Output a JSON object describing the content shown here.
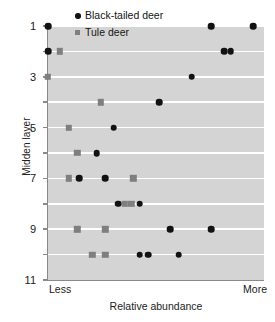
{
  "chart_data": {
    "type": "scatter",
    "title": "",
    "xlabel": "Relative abundance",
    "ylabel": "Midden layer",
    "xlim": [
      0,
      1
    ],
    "ylim": [
      11,
      1
    ],
    "y_inverted": true,
    "grid": "horizontal",
    "plot_background": "#d4d4d4",
    "gridline_color": "#ffffff",
    "x_axis_endpoints": {
      "left": "Less",
      "right": "More"
    },
    "x_tick_labels": [],
    "y_tick_values": [
      1,
      2,
      3,
      4,
      5,
      6,
      7,
      8,
      9,
      10,
      11
    ],
    "y_tick_labels": [
      "1",
      "",
      "3",
      "",
      "5",
      "",
      "7",
      "",
      "9",
      "",
      "11"
    ],
    "legend_position": "top-center",
    "series": [
      {
        "name": "Black-tailed deer",
        "marker": "circle",
        "color": "#121212",
        "points": [
          {
            "x": 0.0,
            "y": 1
          },
          {
            "x": 0.755,
            "y": 1
          },
          {
            "x": 0.95,
            "y": 1
          },
          {
            "x": 0.0,
            "y": 2
          },
          {
            "x": 0.815,
            "y": 2
          },
          {
            "x": 0.845,
            "y": 2
          },
          {
            "x": 0.665,
            "y": 3
          },
          {
            "x": 0.515,
            "y": 4
          },
          {
            "x": 0.305,
            "y": 5
          },
          {
            "x": 0.225,
            "y": 6
          },
          {
            "x": 0.145,
            "y": 7
          },
          {
            "x": 0.265,
            "y": 7
          },
          {
            "x": 0.325,
            "y": 8
          },
          {
            "x": 0.425,
            "y": 8
          },
          {
            "x": 0.565,
            "y": 9
          },
          {
            "x": 0.755,
            "y": 9
          },
          {
            "x": 0.425,
            "y": 10
          },
          {
            "x": 0.465,
            "y": 10
          },
          {
            "x": 0.605,
            "y": 10
          }
        ]
      },
      {
        "name": "Tule deer",
        "marker": "square",
        "color": "#7f7f7f",
        "points": [
          {
            "x": 0.055,
            "y": 2
          },
          {
            "x": 0.0,
            "y": 3
          },
          {
            "x": 0.245,
            "y": 4
          },
          {
            "x": 0.095,
            "y": 5
          },
          {
            "x": 0.135,
            "y": 6
          },
          {
            "x": 0.095,
            "y": 7
          },
          {
            "x": 0.395,
            "y": 7
          },
          {
            "x": 0.355,
            "y": 8
          },
          {
            "x": 0.385,
            "y": 8
          },
          {
            "x": 0.135,
            "y": 9
          },
          {
            "x": 0.265,
            "y": 9
          },
          {
            "x": 0.205,
            "y": 10
          },
          {
            "x": 0.265,
            "y": 10
          }
        ]
      }
    ]
  },
  "legend": {
    "items": [
      {
        "label": "Black-tailed deer",
        "marker": "circle"
      },
      {
        "label": "Tule deer",
        "marker": "square"
      }
    ]
  }
}
